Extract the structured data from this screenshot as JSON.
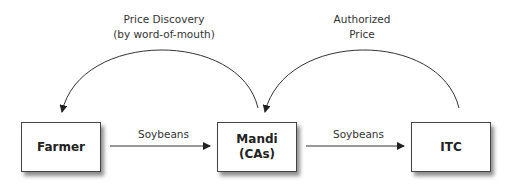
{
  "nodes": {
    "farmer": "Farmer",
    "mandi_line1": "Mandi",
    "mandi_line2": "(CAs)",
    "itc": "ITC"
  },
  "edges": {
    "farmer_to_mandi": "Soybeans",
    "mandi_to_itc": "Soybeans",
    "mandi_to_farmer_line1": "Price Discovery",
    "mandi_to_farmer_line2": "(by word-of-mouth)",
    "itc_to_mandi_line1": "Authorized",
    "itc_to_mandi_line2": "Price"
  }
}
